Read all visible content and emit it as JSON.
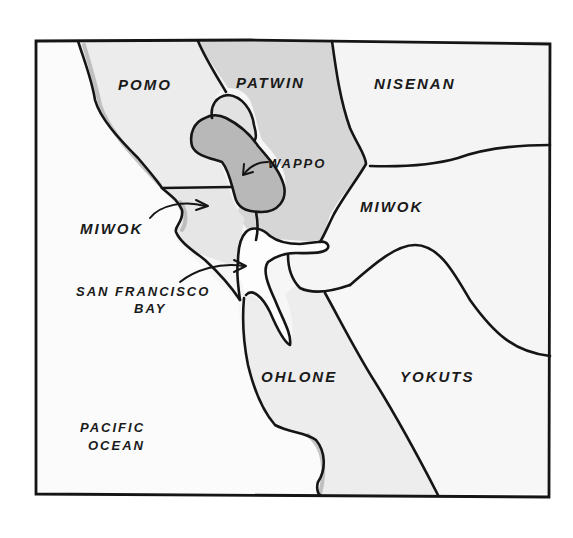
{
  "map": {
    "title": "Tribal territories around San Francisco Bay",
    "style": "hand-drawn pencil sketch",
    "colors": {
      "ink": "#151515",
      "paper": "#f7f7f7",
      "light_shade": "#e4e4e4",
      "medium_shade": "#cfcfcf",
      "dark_shade": "#b2b2b2",
      "water": "#fbfbfb"
    },
    "territories": [
      {
        "id": "pomo",
        "label": "POMO"
      },
      {
        "id": "patwin",
        "label": "PATWIN"
      },
      {
        "id": "nisenan",
        "label": "NISENAN"
      },
      {
        "id": "wappo",
        "label": "WAPPO"
      },
      {
        "id": "miwok-west",
        "label": "MIWOK"
      },
      {
        "id": "miwok-east",
        "label": "MIWOK"
      },
      {
        "id": "ohlone",
        "label": "OHLONE"
      },
      {
        "id": "yokuts",
        "label": "YOKUTS"
      }
    ],
    "water_labels": {
      "bay_line1": "SAN FRANCISCO",
      "bay_line2": "BAY",
      "ocean_line1": "PACIFIC",
      "ocean_line2": "OCEAN"
    },
    "arrows": [
      {
        "from": "MIWOK",
        "to": "miwok-west region"
      },
      {
        "from": "WAPPO",
        "to": "wappo region"
      },
      {
        "from": "SAN FRANCISCO BAY",
        "to": "bay strait"
      }
    ]
  }
}
